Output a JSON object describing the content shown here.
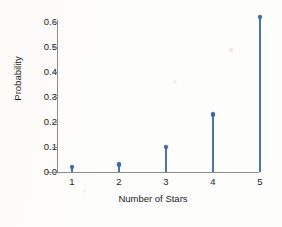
{
  "chart_data": {
    "type": "scatter",
    "title": "",
    "subtitle": "",
    "xlabel": "Number of Stars",
    "ylabel": "Probability",
    "categories": [
      1,
      2,
      3,
      4,
      5
    ],
    "x": [
      1,
      2,
      3,
      4,
      5
    ],
    "values": [
      0.02,
      0.03,
      0.1,
      0.23,
      0.62
    ],
    "series": [
      {
        "name": "Probability",
        "values": [
          0.02,
          0.03,
          0.1,
          0.23,
          0.62
        ]
      }
    ],
    "xlim": [
      0.5,
      5.5
    ],
    "ylim": [
      0.0,
      0.65
    ],
    "ytick_labels": [
      "0.0",
      "0.1",
      "0.2",
      "0.3",
      "0.4",
      "0.5",
      "0.6"
    ],
    "ytick_values": [
      0.0,
      0.1,
      0.2,
      0.3,
      0.4,
      0.5,
      0.6
    ],
    "xtick_labels": [
      "1",
      "2",
      "3",
      "4",
      "5"
    ],
    "grid": false,
    "legend": false,
    "legend_position": "none",
    "marker_style": "stem-with-circle-marker",
    "colors": {
      "marker": "#3f66a8",
      "stem": "#4a73b0",
      "axis": "#8d8d8d",
      "text": "#1d1d1d",
      "background": "#fdfdfb"
    }
  }
}
